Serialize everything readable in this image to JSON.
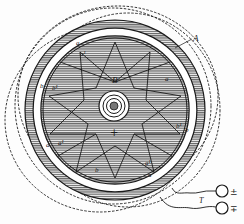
{
  "figure": {
    "colors": {
      "ink": "#1a1a1a",
      "hatch": "#555555",
      "paper": "#fdfdfd"
    },
    "labels": {
      "A": "A",
      "B": "B",
      "a_top": "a",
      "a1_top": "a¹",
      "a_right": "a",
      "b_left": "b",
      "b1_left": "b¹",
      "a_left": "a",
      "a1_left": "a¹",
      "b_right": "b",
      "b1_right": "b¹",
      "a_bottom": "a",
      "a1_bottom": "a¹",
      "b_bottom": "b",
      "T": "T",
      "center_plus": "+"
    },
    "terminals": [
      {
        "id": "terminal-1",
        "sign": "±"
      },
      {
        "id": "terminal-2",
        "sign": "∓"
      }
    ]
  }
}
